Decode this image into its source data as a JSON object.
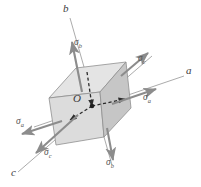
{
  "figure": {
    "background_color": "#ffffff"
  },
  "origin": {
    "label": "O"
  },
  "axes": [
    {
      "id": "a",
      "label": "a",
      "description": "axis a, upper right"
    },
    {
      "id": "b",
      "label": "b",
      "description": "axis b, upper left"
    },
    {
      "id": "c",
      "label": "c",
      "description": "axis c, lower left"
    }
  ],
  "stresses": [
    {
      "id": "sigma-a-right",
      "symbol": "σ",
      "subscript": "a",
      "direction": "right"
    },
    {
      "id": "sigma-a-left",
      "symbol": "σ",
      "subscript": "a",
      "direction": "left"
    },
    {
      "id": "sigma-b-up",
      "symbol": "σ",
      "subscript": "b",
      "direction": "up"
    },
    {
      "id": "sigma-b-down",
      "symbol": "σ",
      "subscript": "b",
      "direction": "down"
    },
    {
      "id": "sigma-c-up-right",
      "symbol": "σ",
      "subscript": "c",
      "direction": "up-right"
    },
    {
      "id": "sigma-c-down-left",
      "symbol": "σ",
      "subscript": "c",
      "direction": "down-left"
    }
  ],
  "cube": {
    "top_face_color": "#e2e2e2",
    "left_face_color": "#dedede",
    "right_face_color": "#c9c9c9",
    "edge_color": "#8a8a8a"
  },
  "colors": {
    "arrow": "#8c8c8c",
    "axis_line": "#9a9a9a",
    "dashed": "#2b2b2b",
    "text": "#4a4a4a"
  }
}
